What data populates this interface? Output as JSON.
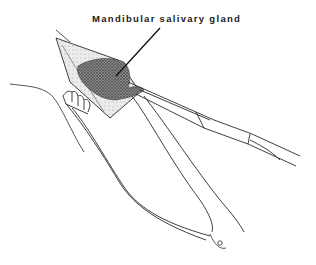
{
  "figure": {
    "label": "Mandibular salivary gland",
    "elements": [
      {
        "name": "mandibular-salivary-gland",
        "type": "stippled tissue"
      },
      {
        "name": "incision-wound",
        "type": "triangular skin opening"
      },
      {
        "name": "toothed-retractor",
        "type": "surgical retractor with rake teeth"
      },
      {
        "name": "hemostatic-forceps",
        "type": "curved forceps clamping gland"
      },
      {
        "name": "skin-contour",
        "type": "outline of neck"
      },
      {
        "name": "leader-line",
        "type": "pointer from label to gland"
      }
    ],
    "colors": {
      "ink": "#2a2a2a",
      "stipple": "#555555",
      "background": "#ffffff"
    }
  }
}
